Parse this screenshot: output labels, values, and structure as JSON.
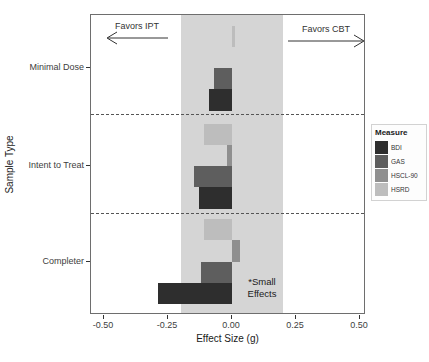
{
  "chart_data": {
    "type": "bar",
    "orientation": "horizontal",
    "title": "",
    "xlabel": "Effect Size (g)",
    "ylabel": "Sample Type",
    "categories": [
      "Minimal Dose",
      "Intent to Treat",
      "Completer"
    ],
    "series": [
      {
        "name": "BDI",
        "color": "#2e2e2e",
        "values": [
          -0.09,
          -0.13,
          -0.29
        ]
      },
      {
        "name": "GAS",
        "color": "#5e5e5e",
        "values": [
          -0.07,
          -0.15,
          -0.12
        ]
      },
      {
        "name": "HSCL-90",
        "color": "#8f8f8f",
        "values": [
          0.0,
          -0.02,
          0.03
        ]
      },
      {
        "name": "HSRD",
        "color": "#bdbdbd",
        "values": [
          0.01,
          -0.11,
          -0.11
        ]
      }
    ],
    "bar_order_top_to_bottom": [
      "HSRD",
      "HSCL-90",
      "GAS",
      "BDI"
    ],
    "x_ticks": [
      {
        "value": -0.5,
        "label": "-0.50"
      },
      {
        "value": -0.25,
        "label": "-0.25"
      },
      {
        "value": 0.0,
        "label": "0.00"
      },
      {
        "value": 0.25,
        "label": "0.25"
      },
      {
        "value": 0.5,
        "label": "0.50"
      }
    ],
    "xlim": [
      -0.55,
      0.52
    ],
    "grid": "off",
    "shaded_region": {
      "from": -0.2,
      "to": 0.2,
      "color": "#d5d5d5"
    },
    "legend": {
      "title": "Measure",
      "position": "right",
      "entries": [
        "BDI",
        "GAS",
        "HSCL-90",
        "HSRD"
      ]
    },
    "annotations": {
      "favors_left": "Favors IPT",
      "favors_right": "Favors CBT",
      "small_effects_line1": "*Small",
      "small_effects_line2": "Effects"
    }
  },
  "colors": {
    "panel_border": "#6e6e6e",
    "separator": "#555555",
    "shade": "#d5d5d5",
    "arrow": "#333333"
  }
}
